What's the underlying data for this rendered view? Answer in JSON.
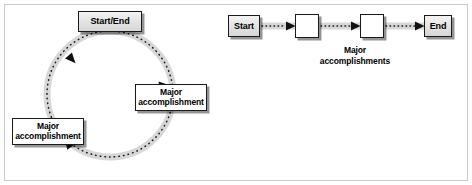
{
  "figure": {
    "background_color": "#ffffff",
    "frame_color": "#c9c9c9",
    "box_border_color": "#1a1a1a",
    "connector_band_color": "#d5d5d5",
    "connector_dot_color": "#1a1a1a"
  },
  "cycle_diagram": {
    "name": "circular-process",
    "nodes": [
      {
        "id": "start-end",
        "label": "Start/End",
        "fill": "gray",
        "position": "top"
      },
      {
        "id": "major-right",
        "label_line1": "Major",
        "label_line2": "accomplishment",
        "fill": "white",
        "position": "right"
      },
      {
        "id": "major-left",
        "label_line1": "Major",
        "label_line2": "accomplishment",
        "fill": "white",
        "position": "left"
      }
    ],
    "flow_direction": "clockwise",
    "connector_style": "dotted-arrow"
  },
  "chain_diagram": {
    "name": "linear-process",
    "nodes": [
      {
        "id": "start",
        "label": "Start",
        "fill": "gray"
      },
      {
        "id": "mid-1",
        "label": "",
        "fill": "white"
      },
      {
        "id": "mid-2",
        "label": "",
        "fill": "white"
      },
      {
        "id": "end",
        "label": "End",
        "fill": "gray"
      }
    ],
    "caption_line1": "Major",
    "caption_line2": "accomplishments",
    "flow_direction": "left-to-right",
    "connector_style": "dotted-arrow"
  }
}
